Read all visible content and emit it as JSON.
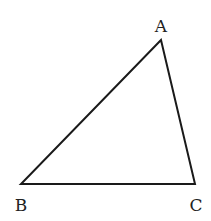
{
  "diagram": {
    "type": "triangle",
    "stroke_color": "#1a1a1a",
    "background": "#ffffff",
    "vertices": [
      {
        "id": "A",
        "label": "A",
        "x": 161,
        "y": 40,
        "label_x": 161,
        "label_y": 32
      },
      {
        "id": "B",
        "label": "B",
        "x": 21,
        "y": 184,
        "label_x": 21,
        "label_y": 211
      },
      {
        "id": "C",
        "label": "C",
        "x": 195,
        "y": 184,
        "label_x": 196,
        "label_y": 211
      }
    ],
    "edges": [
      {
        "from": "A",
        "to": "B"
      },
      {
        "from": "B",
        "to": "C"
      },
      {
        "from": "C",
        "to": "A"
      }
    ]
  }
}
